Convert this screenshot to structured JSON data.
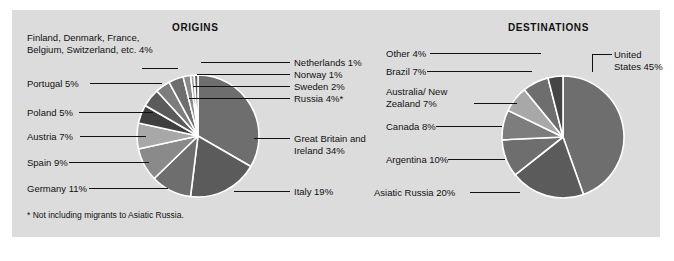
{
  "panel": {
    "background": "#dcdcdc",
    "page_background": "#ffffff"
  },
  "charts": {
    "origins": {
      "title": "ORIGINS",
      "footnote": "* Not including migrants to Asiatic Russia."
    },
    "destinations": {
      "title": "DESTINATIONS"
    }
  },
  "labels": {
    "origins": {
      "misc": "Finland, Denmark, France, Belgium, Switzerland, etc.  4%",
      "portugal": "Portugal  5%",
      "poland": "Poland  5%",
      "austria": "Austria  7%",
      "spain": "Spain  9%",
      "germany": "Germany  11%",
      "netherlands": "Netherlands  1%",
      "norway": "Norway  1%",
      "sweden": "Sweden  2%",
      "russia": "Russia  4%*",
      "britain": "Great Britain and Ireland  34%",
      "italy": "Italy  19%"
    },
    "destinations": {
      "other": "Other  4%",
      "brazil": "Brazil  7%",
      "australia": "Australia/ New Zealand  7%",
      "canada": "Canada  8%",
      "argentina": "Argentina  10%",
      "asiatic_russia": "Asiatic Russia  20%",
      "united_states": "United States 45%"
    }
  },
  "chart_data": [
    {
      "type": "pie",
      "title": "ORIGINS",
      "id": "origins",
      "note": "* Not including migrants to Asiatic Russia.",
      "start_angle_deg": 0,
      "direction": "clockwise",
      "separator_color": "#ffffff",
      "categories": [
        "Great Britain and Ireland",
        "Italy",
        "Germany",
        "Spain",
        "Austria",
        "Poland",
        "Portugal",
        "Finland, Denmark, France, Belgium, Switzerland, etc.",
        "Russia",
        "Sweden",
        "Norway",
        "Netherlands"
      ],
      "values": [
        34,
        19,
        11,
        9,
        7,
        5,
        5,
        4,
        4,
        2,
        1,
        1
      ],
      "unit": "percent",
      "slice_colors": [
        "#6e6e6e",
        "#5b5b5b",
        "#6e6e6e",
        "#8a8a8a",
        "#a8a8a8",
        "#3f3f3f",
        "#5b5b5b",
        "#7d7d7d",
        "#6e6e6e",
        "#8a8a8a",
        "#a0a0a0",
        "#5b5b5b"
      ],
      "labels": [
        "Great Britain and Ireland  34%",
        "Italy  19%",
        "Germany  11%",
        "Spain  9%",
        "Austria  7%",
        "Poland  5%",
        "Portugal  5%",
        "Finland, Denmark, France, Belgium, Switzerland, etc.  4%",
        "Russia  4%*",
        "Sweden  2%",
        "Norway  1%",
        "Netherlands  1%"
      ]
    },
    {
      "type": "pie",
      "title": "DESTINATIONS",
      "id": "destinations",
      "start_angle_deg": 0,
      "direction": "clockwise",
      "separator_color": "#ffffff",
      "categories": [
        "United States",
        "Asiatic Russia",
        "Argentina",
        "Canada",
        "Australia/New Zealand",
        "Brazil",
        "Other"
      ],
      "values": [
        45,
        20,
        10,
        8,
        7,
        7,
        4
      ],
      "unit": "percent",
      "slice_colors": [
        "#6e6e6e",
        "#5b5b5b",
        "#6e6e6e",
        "#7d7d7d",
        "#a8a8a8",
        "#6e6e6e",
        "#454545"
      ],
      "labels": [
        "United States 45%",
        "Asiatic Russia  20%",
        "Argentina  10%",
        "Canada  8%",
        "Australia/ New Zealand  7%",
        "Brazil  7%",
        "Other  4%"
      ]
    }
  ]
}
